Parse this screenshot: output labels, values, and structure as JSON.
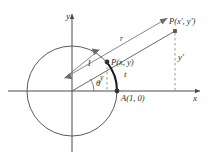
{
  "figure": {
    "colors": {
      "background": "#ffffff",
      "stroke": "#555555",
      "axis": "#4a4a4a",
      "arc": "#1a1a1a",
      "dashed": "#8c8c8c",
      "text": "#2b2b2b",
      "point_fill": "#3a3a3a"
    },
    "axes": {
      "x_label": "x",
      "y_label": "y",
      "origin_label": ""
    },
    "labels": {
      "point_on_circle": "P(x, y)",
      "point_on_ray": "P(x', y')",
      "point_a": "A(1, 0)",
      "radius_unit": "1",
      "radius_r": "r",
      "arc_length": "t",
      "angle": "θ",
      "y_short": "y",
      "y_prime": "y′"
    },
    "geometry": {
      "origin": {
        "x": 72,
        "y": 91
      },
      "circle_radius": 45,
      "point_a": {
        "x": 117,
        "y": 91
      },
      "point_on_circle": {
        "x": 107,
        "y": 62
      },
      "point_on_ray": {
        "x": 175,
        "y": 31
      },
      "angle_degrees": 33
    }
  }
}
